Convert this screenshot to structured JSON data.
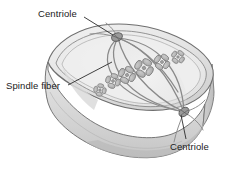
{
  "figure": {
    "background_color": "#ffffff",
    "width": 236,
    "height": 178
  },
  "labels": {
    "centriole_top": "Centriole",
    "spindle_fiber": "Spindle fiber",
    "centriole_bottom": "Centriole"
  },
  "colors": {
    "outline": "#6b6b6b",
    "membrane_outer": "#7a7a7a",
    "cell_top_face": "#e9e9e9",
    "cell_front_face": "#dcdcdc",
    "cell_side_face": "#cfcfcf",
    "cytoplasm": "#eeeeee",
    "spindle_fiber": "#8a8a8a",
    "chromosome_fill": "#b5b5b5",
    "chromosome_stroke": "#7d7d7d",
    "centriole_fill": "#9a9a9a",
    "centriole_stroke": "#5e5e5e",
    "leader_line": "#2b2b2b",
    "text": "#1a1a1a"
  },
  "structures": {
    "cell_shape": "rounded-3d-box",
    "pole_top": {
      "x": 118,
      "y": 38
    },
    "pole_bottom": {
      "x": 184,
      "y": 112
    },
    "spindle_fiber_count": 5,
    "chromosome_count": 5,
    "chromosome_shape": "X-shaped-replicated"
  }
}
